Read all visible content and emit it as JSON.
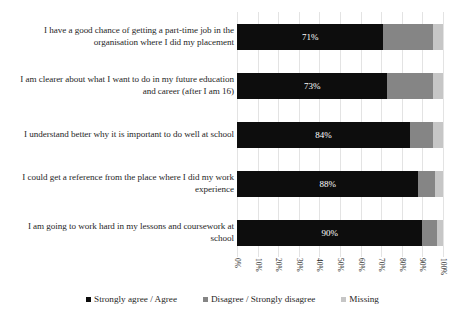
{
  "chart_data": {
    "type": "bar",
    "orientation": "horizontal",
    "stacked": true,
    "title": "",
    "subtitle": "",
    "xlabel": "",
    "ylabel": "",
    "xlim": [
      0,
      100
    ],
    "grid": true,
    "legend_position": "bottom",
    "categories": [
      "I have a good chance of getting a part-time job in the organisation where I did my placement",
      "I am clearer about what I want to do in my future education and career (after I am 16)",
      "I understand better why it is important to do well at school",
      "I could get a reference from the place where I did my work experience",
      "I am going to work hard in my lessons and coursework at school"
    ],
    "tick_labels": [
      "0%",
      "10%",
      "20%",
      "30%",
      "40%",
      "50%",
      "60%",
      "70%",
      "80%",
      "90%",
      "100%"
    ],
    "tick_values": [
      0,
      10,
      20,
      30,
      40,
      50,
      60,
      70,
      80,
      90,
      100
    ],
    "series": [
      {
        "name": "Strongly agree / Agree",
        "color": "#0d0d0d",
        "values": [
          71,
          73,
          84,
          88,
          90
        ],
        "data_labels": [
          "71%",
          "73%",
          "84%",
          "88%",
          "90%"
        ]
      },
      {
        "name": "Disagree / Strongly disagree",
        "color": "#858585",
        "values": [
          24,
          22,
          11,
          8,
          7
        ],
        "data_labels": [
          "",
          "",
          "",
          "",
          ""
        ]
      },
      {
        "name": "Missing",
        "color": "#c6c6c6",
        "values": [
          5,
          5,
          5,
          4,
          3
        ],
        "data_labels": [
          "",
          "",
          "",
          "",
          ""
        ]
      }
    ]
  },
  "legend": {
    "items": [
      {
        "label": "Strongly agree / Agree",
        "color": "#0d0d0d"
      },
      {
        "label": "Disagree / Strongly disagree",
        "color": "#858585"
      },
      {
        "label": "Missing",
        "color": "#c6c6c6"
      }
    ]
  }
}
